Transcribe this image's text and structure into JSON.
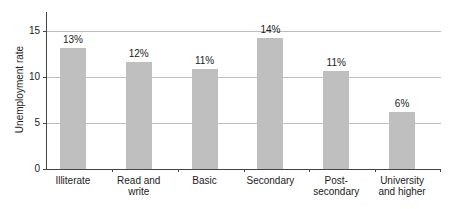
{
  "chart_data": {
    "type": "bar",
    "title": "",
    "xlabel": "",
    "ylabel": "Unemployment rate",
    "ylim": [
      0,
      17
    ],
    "yticks": [
      0,
      5,
      10,
      15
    ],
    "grid": true,
    "legend": null,
    "categories": [
      "Illiterate",
      "Read and\nwrite",
      "Basic",
      "Secondary",
      "Post-\nsecondary",
      "University\nand higher"
    ],
    "values": [
      13.2,
      11.6,
      10.9,
      14.2,
      10.7,
      6.2
    ],
    "data_labels": [
      "13%",
      "12%",
      "11%",
      "14%",
      "11%",
      "6%"
    ],
    "bar_color": "#bfbfbf"
  }
}
